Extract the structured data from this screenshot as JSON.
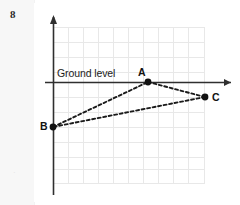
{
  "page": {
    "question_number": "8",
    "background_color": "#ffffff",
    "margin_color": "#f7f7f7"
  },
  "figure": {
    "type": "coordinate-diagram",
    "caption_labels": {
      "ground_level": "Ground level"
    },
    "axes": {
      "x_axis": {
        "name": "ground-level-axis",
        "color": "#2f2f2f",
        "arrow": "right",
        "y_pixel": 79
      },
      "y_axis": {
        "name": "vertical-axis",
        "color": "#2f2f2f",
        "arrow": "up",
        "x_pixel": 19
      }
    },
    "grid": {
      "visible": true,
      "cell_size": 15,
      "color": "#e8e8e8",
      "columns": 10,
      "rows": 11,
      "left": 19,
      "top": 24,
      "right": 171,
      "bottom": 181
    },
    "points": [
      {
        "label": "A",
        "x": 114,
        "y": 79,
        "on_axis": "x-axis"
      },
      {
        "label": "B",
        "x": 19,
        "y": 124,
        "on_axis": "y-axis"
      },
      {
        "label": "C",
        "x": 171,
        "y": 94,
        "on_axis": "none"
      }
    ],
    "edges": [
      {
        "from": "B",
        "to": "A",
        "style": "dashed"
      },
      {
        "from": "A",
        "to": "C",
        "style": "dashed"
      },
      {
        "from": "C",
        "to": "B",
        "style": "dashed"
      }
    ],
    "colors": {
      "axis": "#2f2f2f",
      "grid": "#e8e8e8",
      "dash": "#1a1a1a",
      "point": "#111111",
      "text": "#1c1c1c"
    }
  }
}
